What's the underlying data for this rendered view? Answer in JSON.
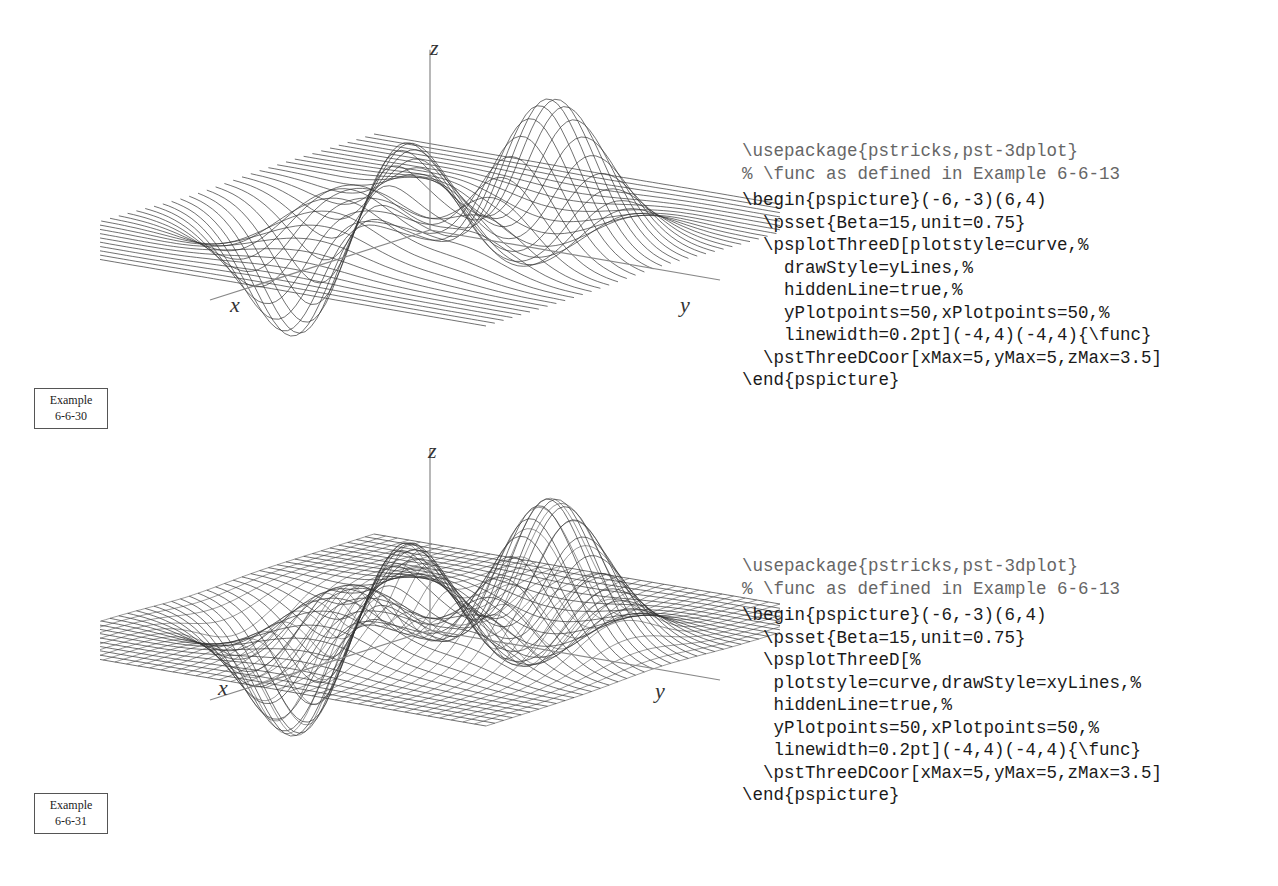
{
  "examples": [
    {
      "label_line1": "Example",
      "label_line2": "6-6-30",
      "plot": {
        "drawStyle": "yLines",
        "axes": {
          "x": "x",
          "y": "y",
          "z": "z"
        }
      },
      "code": [
        {
          "text": "\\usepackage{pstricks,pst-3dplot}",
          "style": "comment"
        },
        {
          "text": "% \\func as defined in Example 6-6-13",
          "style": "comment"
        },
        {
          "text": "\\begin{pspicture}(-6,-3)(6,4)",
          "style": "normal"
        },
        {
          "text": "  \\psset{Beta=15,unit=0.75}",
          "style": "normal"
        },
        {
          "text": "  \\psplotThreeD[plotstyle=curve,%",
          "style": "normal"
        },
        {
          "text": "    drawStyle=yLines,%",
          "style": "normal"
        },
        {
          "text": "    hiddenLine=true,%",
          "style": "normal"
        },
        {
          "text": "    yPlotpoints=50,xPlotpoints=50,%",
          "style": "normal"
        },
        {
          "text": "    linewidth=0.2pt](-4,4)(-4,4){\\func}",
          "style": "normal"
        },
        {
          "text": "  \\pstThreeDCoor[xMax=5,yMax=5,zMax=3.5]",
          "style": "normal"
        },
        {
          "text": "\\end{pspicture}",
          "style": "normal"
        }
      ]
    },
    {
      "label_line1": "Example",
      "label_line2": "6-6-31",
      "plot": {
        "drawStyle": "xyLines",
        "axes": {
          "x": "x",
          "y": "y",
          "z": "z"
        }
      },
      "code": [
        {
          "text": "\\usepackage{pstricks,pst-3dplot}",
          "style": "comment"
        },
        {
          "text": "% \\func as defined in Example 6-6-13",
          "style": "comment"
        },
        {
          "text": "\\begin{pspicture}(-6,-3)(6,4)",
          "style": "normal"
        },
        {
          "text": "  \\psset{Beta=15,unit=0.75}",
          "style": "normal"
        },
        {
          "text": "  \\psplotThreeD[%",
          "style": "normal"
        },
        {
          "text": "   plotstyle=curve,drawStyle=xyLines,%",
          "style": "normal"
        },
        {
          "text": "   hiddenLine=true,%",
          "style": "normal"
        },
        {
          "text": "   yPlotpoints=50,xPlotpoints=50,%",
          "style": "normal"
        },
        {
          "text": "   linewidth=0.2pt](-4,4)(-4,4){\\func}",
          "style": "normal"
        },
        {
          "text": "  \\pstThreeDCoor[xMax=5,yMax=5,zMax=3.5]",
          "style": "normal"
        },
        {
          "text": "\\end{pspicture}",
          "style": "normal"
        }
      ]
    }
  ]
}
